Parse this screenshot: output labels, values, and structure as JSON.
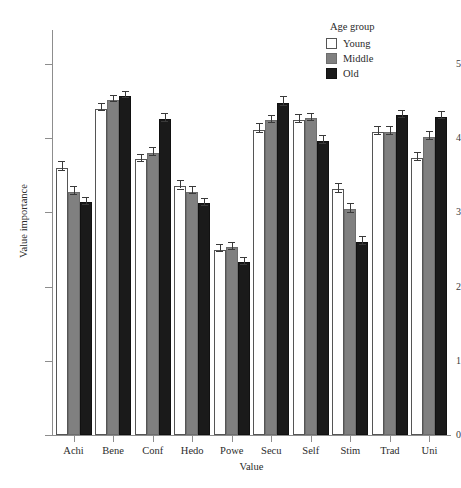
{
  "chart_data": {
    "type": "bar",
    "title": "",
    "xlabel": "Value",
    "ylabel": "Value importance",
    "ylim": [
      0,
      5.4
    ],
    "yticks": [
      0,
      1,
      2,
      3,
      4,
      5
    ],
    "ytick_labels": [
      "0",
      "1",
      "2",
      "3",
      "4",
      "5"
    ],
    "grid": false,
    "legend_position": "top-right",
    "legend_title": "Age group",
    "categories": [
      "Achi",
      "Bene",
      "Conf",
      "Hedo",
      "Powe",
      "Secu",
      "Self",
      "Stim",
      "Trad",
      "Uni"
    ],
    "series": [
      {
        "name": "Young",
        "color": "#ffffff",
        "values": [
          3.6,
          4.4,
          3.72,
          3.35,
          2.5,
          4.11,
          4.24,
          3.31,
          4.09,
          3.73
        ],
        "errors": [
          0.09,
          0.07,
          0.07,
          0.08,
          0.07,
          0.09,
          0.08,
          0.09,
          0.08,
          0.08
        ]
      },
      {
        "name": "Middle",
        "color": "#808080",
        "values": [
          3.27,
          4.52,
          3.8,
          3.28,
          2.53,
          4.24,
          4.27,
          3.04,
          4.08,
          4.02
        ],
        "errors": [
          0.08,
          0.06,
          0.08,
          0.07,
          0.07,
          0.07,
          0.07,
          0.09,
          0.08,
          0.08
        ]
      },
      {
        "name": "Old",
        "color": "#1a1a1a",
        "values": [
          3.14,
          4.57,
          4.26,
          3.12,
          2.33,
          4.48,
          3.96,
          2.6,
          4.31,
          4.29
        ],
        "errors": [
          0.07,
          0.06,
          0.08,
          0.07,
          0.07,
          0.09,
          0.08,
          0.08,
          0.07,
          0.07
        ]
      }
    ]
  },
  "legend": {
    "title": "Age group",
    "entries": [
      {
        "label": "Young",
        "swatch": "young"
      },
      {
        "label": "Middle",
        "swatch": "middle"
      },
      {
        "label": "Old",
        "swatch": "old"
      }
    ]
  },
  "axes": {
    "y_title": "Value importance",
    "x_title": "Value"
  }
}
